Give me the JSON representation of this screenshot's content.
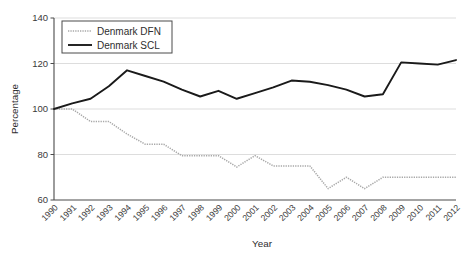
{
  "chart_data": {
    "type": "line",
    "title": "",
    "xlabel": "Year",
    "ylabel": "Percentage",
    "categories": [
      "1990",
      "1991",
      "1992",
      "1993",
      "1994",
      "1995",
      "1996",
      "1997",
      "1998",
      "1999",
      "2000",
      "2001",
      "2002",
      "2003",
      "2004",
      "2005",
      "2006",
      "2007",
      "2008",
      "2009",
      "2010",
      "2011",
      "2012"
    ],
    "x": [
      1990,
      1991,
      1992,
      1993,
      1994,
      1995,
      1996,
      1997,
      1998,
      1999,
      2000,
      2001,
      2002,
      2003,
      2004,
      2005,
      2006,
      2007,
      2008,
      2009,
      2010,
      2011,
      2012
    ],
    "xlim": [
      1990,
      2012
    ],
    "ylim": [
      60,
      140
    ],
    "yticks": [
      60,
      80,
      100,
      120,
      140
    ],
    "ytick_labels": [
      "60",
      "80",
      "100",
      "120",
      "140"
    ],
    "grid": "horizontal",
    "legend_position": "top-left",
    "series": [
      {
        "name": "Denmark DFN",
        "style": "dotted",
        "color": "#a8a8a8",
        "values": [
          100,
          100,
          94.5,
          94.5,
          89,
          84.5,
          84.5,
          79.5,
          79.5,
          79.5,
          74.5,
          79.5,
          75,
          75,
          75,
          65,
          70,
          65,
          70,
          70,
          70,
          70,
          70
        ]
      },
      {
        "name": "Denmark SCL",
        "style": "solid",
        "color": "#1a1a1a",
        "values": [
          100,
          102.5,
          104.5,
          110,
          117,
          114.5,
          112,
          108.5,
          105.5,
          108,
          104.5,
          107,
          109.5,
          112.5,
          112,
          110.5,
          108.5,
          105.5,
          106.5,
          120.5,
          120,
          119.5,
          121.5
        ]
      }
    ]
  },
  "legend": {
    "entries": [
      {
        "label": "Denmark DFN"
      },
      {
        "label": "Denmark SCL"
      }
    ]
  }
}
